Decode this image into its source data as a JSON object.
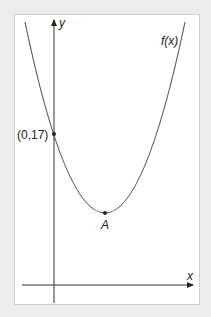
{
  "figure": {
    "function_label": "f(x)",
    "x_axis_label": "x",
    "y_axis_label": "y",
    "intercept_label": "(0,17)",
    "vertex_label": "A"
  },
  "colors": {
    "background": "#ececec",
    "panel": "#ffffff",
    "curve": "#555555",
    "axes": "#333333"
  }
}
